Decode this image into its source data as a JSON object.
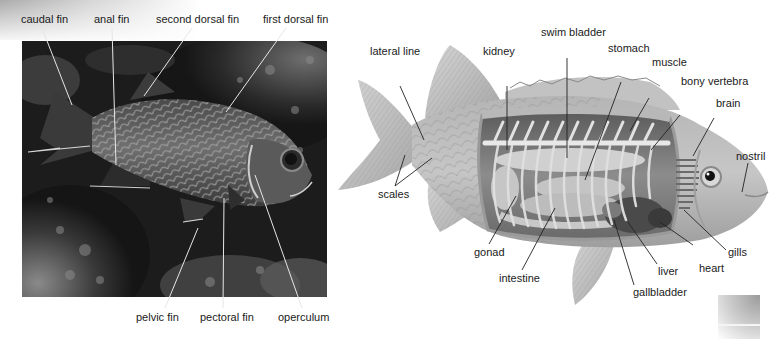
{
  "photo_panel": {
    "description": "Photograph of a squirrelfish over a reef",
    "labels": {
      "caudal_fin": "caudal fin",
      "anal_fin": "anal fin",
      "second_dorsal_fin": "second dorsal fin",
      "first_dorsal_fin": "first dorsal fin",
      "pelvic_fin": "pelvic fin",
      "pectoral_fin": "pectoral fin",
      "operculum": "operculum"
    }
  },
  "illustration_panel": {
    "description": "Cutaway illustration of bony fish internal anatomy",
    "labels": {
      "lateral_line": "lateral line",
      "kidney": "kidney",
      "swim_bladder": "swim bladder",
      "stomach": "stomach",
      "muscle": "muscle",
      "bony_vertebra": "bony vertebra",
      "brain": "brain",
      "nostril": "nostril",
      "scales": "scales",
      "gonad": "gonad",
      "intestine": "intestine",
      "liver": "liver",
      "heart": "heart",
      "gills": "gills",
      "gallbladder": "gallbladder"
    }
  },
  "colors": {
    "label_text": "#1a1a1a",
    "leader_line_on_photo": "#e8e8e8",
    "leader_line_on_drawing": "#222222",
    "photo_background": "#1c1c1c",
    "fish_body": "#bdbdbd"
  }
}
